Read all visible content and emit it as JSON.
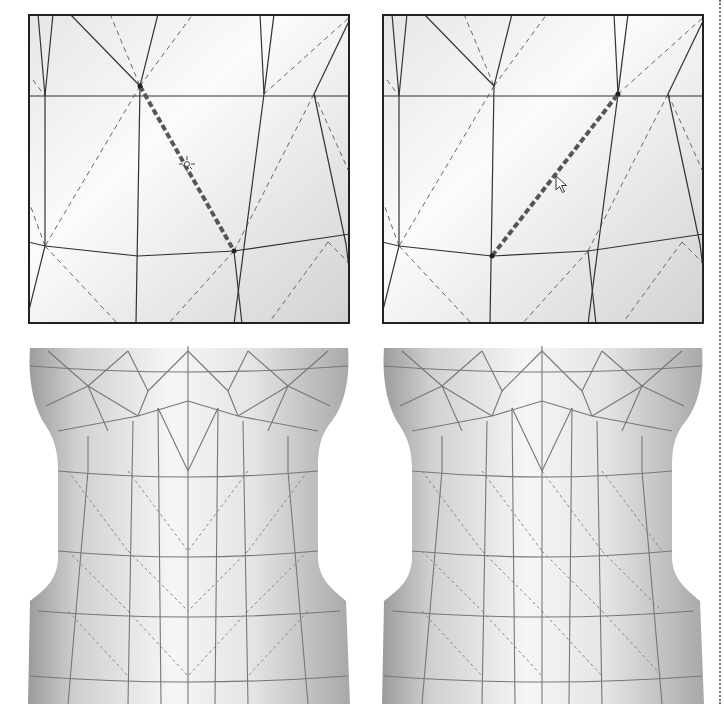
{
  "figure": {
    "colors": {
      "background": "#ffffff",
      "frame": "#222222",
      "mesh_edge": "#333333",
      "hidden_edge": "#666666",
      "selected_edge": "#555555",
      "surface_light": "#f8f8f8",
      "surface_dark": "#bdbdbd"
    }
  },
  "panels": [
    {
      "id": "before-closeup",
      "x": 28,
      "y": 14,
      "w": 322,
      "h": 310,
      "cursor": {
        "type": "crosshair-sun",
        "x": 187,
        "y": 164
      },
      "solid_edges": [
        [
          10,
          0,
          17,
          82
        ],
        [
          17,
          82,
          25,
          0
        ],
        [
          42,
          0,
          112,
          72
        ],
        [
          112,
          72,
          130,
          0
        ],
        [
          112,
          72,
          108,
          310
        ],
        [
          0,
          82,
          338,
          82
        ],
        [
          232,
          0,
          236,
          80
        ],
        [
          236,
          80,
          246,
          0
        ],
        [
          236,
          80,
          206,
          310
        ],
        [
          286,
          80,
          322,
          5
        ],
        [
          286,
          80,
          318,
          230
        ],
        [
          318,
          230,
          322,
          262
        ],
        [
          0,
          228,
          17,
          232
        ],
        [
          17,
          232,
          110,
          242
        ],
        [
          110,
          242,
          206,
          237
        ],
        [
          206,
          237,
          322,
          220
        ],
        [
          17,
          232,
          0,
          300
        ],
        [
          17,
          82,
          17,
          232
        ],
        [
          206,
          237,
          214,
          310
        ]
      ],
      "dashed_edges": [
        [
          5,
          66,
          17,
          82
        ],
        [
          82,
          0,
          112,
          72
        ],
        [
          112,
          72,
          165,
          0
        ],
        [
          236,
          80,
          325,
          0
        ],
        [
          112,
          72,
          17,
          232
        ],
        [
          206,
          237,
          286,
          80
        ],
        [
          286,
          80,
          322,
          160
        ],
        [
          0,
          185,
          17,
          232
        ],
        [
          17,
          232,
          90,
          310
        ],
        [
          206,
          237,
          140,
          310
        ],
        [
          300,
          228,
          240,
          310
        ],
        [
          300,
          228,
          322,
          250
        ]
      ],
      "selected_edge": [
        112,
        72,
        206,
        237
      ]
    },
    {
      "id": "after-closeup",
      "x": 382,
      "y": 14,
      "w": 322,
      "h": 310,
      "cursor": {
        "type": "arrow",
        "x": 556,
        "y": 176
      },
      "solid_edges": [
        [
          10,
          0,
          17,
          82
        ],
        [
          17,
          82,
          25,
          0
        ],
        [
          42,
          0,
          112,
          72
        ],
        [
          112,
          72,
          130,
          0
        ],
        [
          112,
          72,
          108,
          310
        ],
        [
          0,
          82,
          338,
          82
        ],
        [
          232,
          0,
          236,
          80
        ],
        [
          236,
          80,
          246,
          0
        ],
        [
          236,
          80,
          206,
          310
        ],
        [
          286,
          80,
          322,
          5
        ],
        [
          286,
          80,
          318,
          230
        ],
        [
          318,
          230,
          322,
          262
        ],
        [
          0,
          228,
          17,
          232
        ],
        [
          17,
          232,
          110,
          242
        ],
        [
          110,
          242,
          206,
          237
        ],
        [
          206,
          237,
          322,
          220
        ],
        [
          17,
          232,
          0,
          300
        ],
        [
          17,
          82,
          17,
          232
        ],
        [
          206,
          237,
          214,
          310
        ]
      ],
      "dashed_edges": [
        [
          5,
          66,
          17,
          82
        ],
        [
          82,
          0,
          112,
          72
        ],
        [
          112,
          72,
          165,
          0
        ],
        [
          236,
          80,
          325,
          0
        ],
        [
          112,
          72,
          17,
          232
        ],
        [
          206,
          237,
          286,
          80
        ],
        [
          286,
          80,
          322,
          160
        ],
        [
          0,
          185,
          17,
          232
        ],
        [
          17,
          232,
          90,
          310
        ],
        [
          206,
          237,
          140,
          310
        ],
        [
          300,
          228,
          240,
          310
        ],
        [
          300,
          228,
          322,
          250
        ]
      ],
      "selected_edge": [
        110,
        242,
        236,
        80
      ]
    }
  ],
  "torsos": [
    {
      "id": "before-torso",
      "x": 28,
      "y": 346,
      "w": 322,
      "h": 358,
      "diagonal_direction": "left"
    },
    {
      "id": "after-torso",
      "x": 382,
      "y": 346,
      "w": 322,
      "h": 358,
      "diagonal_direction": "right"
    }
  ]
}
